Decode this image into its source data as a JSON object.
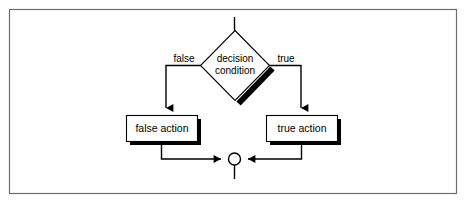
{
  "figure": {
    "background_color": "#ffffff",
    "frame_color": "#6e6e6e",
    "stroke_color": "#000000",
    "shadow_color": "#000000",
    "node_fill": "#ffffff"
  },
  "nodes": {
    "entry": {
      "name": "entry-connector",
      "shape": "line"
    },
    "decision": {
      "name": "decision-diamond",
      "shape": "diamond",
      "label_line1": "decision",
      "label_line2": "condition",
      "center_x": 235,
      "center_y": 65,
      "half_width": 35,
      "half_height": 35
    },
    "false_action": {
      "name": "false-action-box",
      "shape": "rect",
      "label": "false action",
      "x": 126,
      "y": 115,
      "width": 71,
      "height": 26
    },
    "true_action": {
      "name": "true-action-box",
      "shape": "rect",
      "label": "true action",
      "x": 266,
      "y": 115,
      "width": 71,
      "height": 26
    },
    "merge": {
      "name": "merge-circle",
      "shape": "circle",
      "center_x": 234,
      "center_y": 159,
      "radius": 6
    },
    "exit": {
      "name": "exit-connector",
      "shape": "line"
    }
  },
  "edges": [
    {
      "name": "edge-entry-to-decision",
      "label": ""
    },
    {
      "name": "edge-decision-false",
      "label": "false"
    },
    {
      "name": "edge-decision-true",
      "label": "true"
    },
    {
      "name": "edge-false-action-to-merge",
      "label": ""
    },
    {
      "name": "edge-true-action-to-merge",
      "label": ""
    },
    {
      "name": "edge-merge-to-exit",
      "label": ""
    }
  ],
  "labels": {
    "false_branch": "false",
    "true_branch": "true",
    "decision_line1": "decision",
    "decision_line2": "condition",
    "false_action": "false action",
    "true_action": "true action"
  }
}
